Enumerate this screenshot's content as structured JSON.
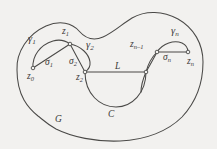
{
  "figure": {
    "name": "contour-decomposition-diagram",
    "colors": {
      "background": "#f2f1ef",
      "stroke": "#4a4947",
      "label": "#3b3a38",
      "vertex_fill": "#f2f1ef"
    },
    "region_label": "G",
    "labels": [
      {
        "id": "gamma1",
        "base": "γ",
        "sub": "1",
        "x": 32,
        "y": 38,
        "size": "sz-lg"
      },
      {
        "id": "z1",
        "base": "z",
        "sub": "1",
        "x": 66,
        "y": 31,
        "size": "sz-md"
      },
      {
        "id": "gamma2",
        "base": "γ",
        "sub": "2",
        "x": 88,
        "y": 44,
        "size": "sz-lg"
      },
      {
        "id": "sigma1",
        "base": "σ",
        "sub": "1",
        "x": 49,
        "y": 63,
        "size": "sz-md"
      },
      {
        "id": "sigma2",
        "base": "σ",
        "sub": "2",
        "x": 72,
        "y": 62,
        "size": "sz-md"
      },
      {
        "id": "z0",
        "base": "z",
        "sub": "0",
        "x": 30,
        "y": 76,
        "size": "sz-md"
      },
      {
        "id": "z2",
        "base": "z",
        "sub": "2",
        "x": 78,
        "y": 76,
        "size": "sz-md"
      },
      {
        "id": "L",
        "base": "L",
        "sub": "",
        "x": 117,
        "y": 68,
        "size": "sz-md"
      },
      {
        "id": "C",
        "base": "C",
        "sub": "",
        "x": 110,
        "y": 98,
        "size": "sz-md"
      },
      {
        "id": "znm1",
        "base": "z",
        "sub": "n–1",
        "x": 135,
        "y": 44,
        "size": "sz-md"
      },
      {
        "id": "gamman",
        "base": "γ",
        "sub": "n",
        "x": 174,
        "y": 30,
        "size": "sz-lg"
      },
      {
        "id": "sigman",
        "base": "σ",
        "sub": "n",
        "x": 169,
        "y": 58,
        "size": "sz-md"
      },
      {
        "id": "zn",
        "base": "z",
        "sub": "n",
        "x": 190,
        "y": 61,
        "size": "sz-md"
      },
      {
        "id": "G",
        "base": "G",
        "sub": "",
        "x": 57,
        "y": 119,
        "size": "sz-md"
      }
    ],
    "vertices": [
      {
        "id": "vz0",
        "cx": 33,
        "cy": 68
      },
      {
        "id": "vz1",
        "cx": 70,
        "cy": 44
      },
      {
        "id": "vz2",
        "cx": 85,
        "cy": 72
      },
      {
        "id": "vL",
        "cx": 146,
        "cy": 72
      },
      {
        "id": "vznm1",
        "cx": 157,
        "cy": 52
      },
      {
        "id": "vzn",
        "cx": 188,
        "cy": 52
      }
    ]
  }
}
